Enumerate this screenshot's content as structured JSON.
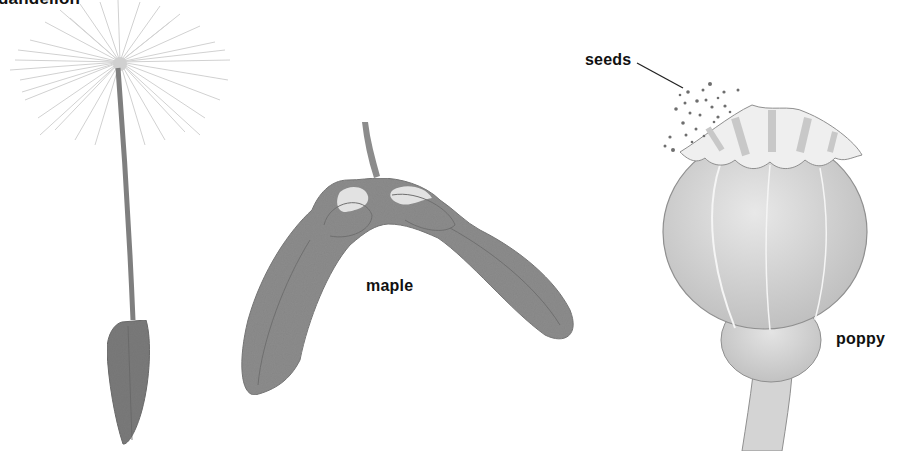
{
  "diagram": {
    "title": "dandelion",
    "plants": [
      {
        "name": "dandelion",
        "label": "dandelion"
      },
      {
        "name": "maple",
        "label": "maple"
      },
      {
        "name": "poppy",
        "label": "poppy"
      }
    ],
    "annotations": {
      "seeds": "seeds"
    },
    "colors": {
      "background": "#ffffff",
      "dandelion_fill": "#7a7a7a",
      "dandelion_fluff": "#cfcfcf",
      "maple_fill": "#8c8c8c",
      "maple_highlight": "#e6e6e6",
      "poppy_fill": "#d6d6d6",
      "poppy_cap": "#efefef",
      "seed_dots": "#6e6e6e",
      "text": "#111111"
    }
  }
}
